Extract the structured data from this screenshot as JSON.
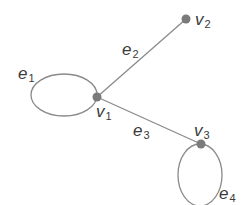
{
  "diagram": {
    "type": "graph",
    "colors": {
      "edge": "#8a8a8a",
      "node": "#7a7a7a",
      "label": "#3a3a3a",
      "background": "#ffffff"
    },
    "vertices": [
      {
        "id": "v1",
        "base": "v",
        "sub": "1",
        "x": 97,
        "y": 97
      },
      {
        "id": "v2",
        "base": "v",
        "sub": "2",
        "x": 186,
        "y": 19
      },
      {
        "id": "v3",
        "base": "v",
        "sub": "3",
        "x": 201,
        "y": 144
      }
    ],
    "edges": [
      {
        "id": "e1",
        "base": "e",
        "sub": "1",
        "type": "loop",
        "at": "v1"
      },
      {
        "id": "e2",
        "base": "e",
        "sub": "2",
        "type": "edge",
        "from": "v1",
        "to": "v2"
      },
      {
        "id": "e3",
        "base": "e",
        "sub": "3",
        "type": "edge",
        "from": "v1",
        "to": "v3"
      },
      {
        "id": "e4",
        "base": "e",
        "sub": "4",
        "type": "loop",
        "at": "v3"
      }
    ]
  }
}
